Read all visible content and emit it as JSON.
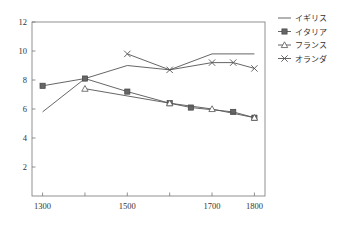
{
  "chart_data": {
    "type": "line",
    "title": "",
    "xlabel": "",
    "ylabel": "",
    "xlim": [
      1275,
      1825
    ],
    "ylim": [
      0,
      12
    ],
    "xticks": [
      1300,
      1400,
      1500,
      1600,
      1700,
      1800
    ],
    "xticklabels": [
      "1300",
      "",
      "1500",
      "",
      "1700",
      "1800"
    ],
    "xticklabels_shown": [
      "1300",
      "1500",
      "1700",
      "1800"
    ],
    "yticks": [
      2,
      4,
      6,
      8,
      10,
      12
    ],
    "yticklabels": [
      "2",
      "4",
      "6",
      "8",
      "10",
      "12"
    ],
    "grid": false,
    "legend_position": "top-right",
    "series": [
      {
        "name": "イギリス",
        "marker": "none",
        "color": "#555555",
        "points": [
          {
            "x": 1300,
            "y": 5.8
          },
          {
            "x": 1400,
            "y": 8.1
          },
          {
            "x": 1500,
            "y": 9.0
          },
          {
            "x": 1600,
            "y": 8.7
          },
          {
            "x": 1700,
            "y": 9.8
          },
          {
            "x": 1750,
            "y": 9.8
          },
          {
            "x": 1800,
            "y": 9.8
          }
        ]
      },
      {
        "name": "イタリア",
        "marker": "filled-square",
        "color": "#555555",
        "points": [
          {
            "x": 1300,
            "y": 7.6
          },
          {
            "x": 1400,
            "y": 8.1
          },
          {
            "x": 1500,
            "y": 7.2
          },
          {
            "x": 1600,
            "y": 6.4
          },
          {
            "x": 1650,
            "y": 6.1
          },
          {
            "x": 1750,
            "y": 5.8
          },
          {
            "x": 1800,
            "y": 5.4
          }
        ]
      },
      {
        "name": "フランス",
        "marker": "open-triangle",
        "color": "#555555",
        "points": [
          {
            "x": 1400,
            "y": 7.4
          },
          {
            "x": 1600,
            "y": 6.4
          },
          {
            "x": 1700,
            "y": 6.0
          },
          {
            "x": 1800,
            "y": 5.4
          }
        ]
      },
      {
        "name": "オランダ",
        "marker": "cross",
        "color": "#555555",
        "points": [
          {
            "x": 1500,
            "y": 9.8
          },
          {
            "x": 1600,
            "y": 8.7
          },
          {
            "x": 1700,
            "y": 9.2
          },
          {
            "x": 1750,
            "y": 9.2
          },
          {
            "x": 1800,
            "y": 8.8
          }
        ]
      }
    ],
    "legend": [
      {
        "label": "イギリス",
        "marker": "none"
      },
      {
        "label": "イタリア",
        "marker": "filled-square"
      },
      {
        "label": "フランス",
        "marker": "open-triangle"
      },
      {
        "label": "オランダ",
        "marker": "cross"
      }
    ]
  }
}
